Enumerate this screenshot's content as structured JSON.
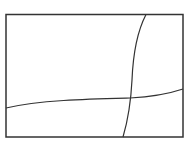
{
  "diagram": {
    "frame": {
      "x": 6,
      "y": 14.5,
      "width": 177,
      "height": 122.5,
      "stroke": "#333333",
      "stroke_width": 1.5
    },
    "curves": [
      {
        "name": "horizontal-curve",
        "path": "M6,108 C40,100 90,99 130,98 C150,97 168,94 183,89",
        "stroke": "#333333",
        "stroke_width": 1.2
      },
      {
        "name": "vertical-curve",
        "path": "M146,14.5 C138,30 133,55 132,80 C131,100 128,120 123,137",
        "stroke": "#333333",
        "stroke_width": 1.2
      }
    ]
  }
}
